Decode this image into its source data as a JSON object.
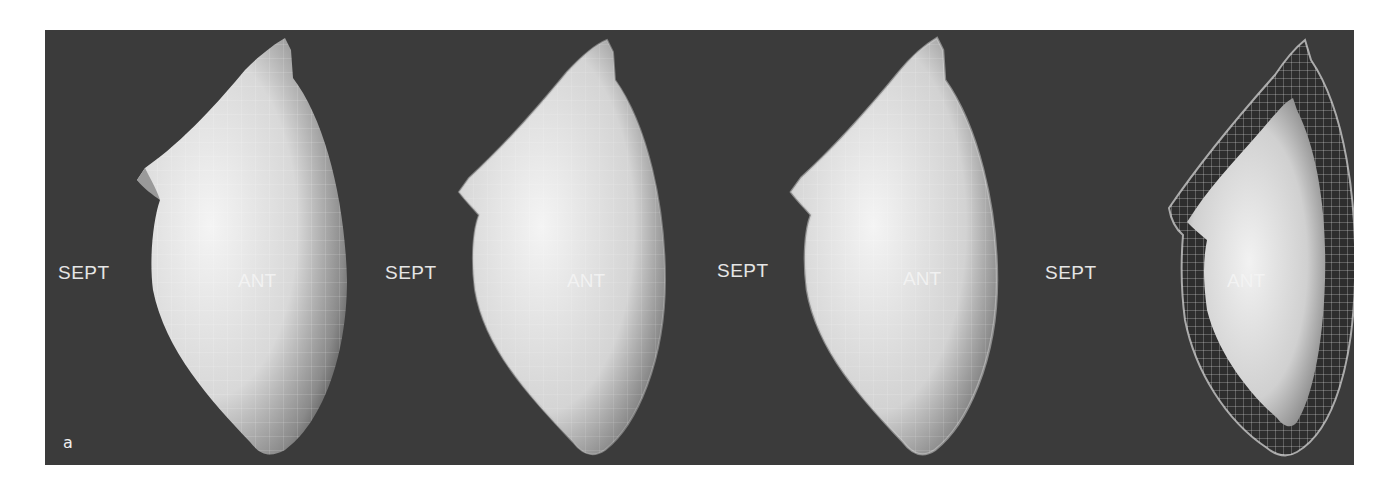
{
  "figure": {
    "panel_label": "a",
    "background_color": "#3b3b3b",
    "panels": [
      {
        "left_label": "SEPT",
        "center_label": "ANT",
        "style": "surface-with-grid"
      },
      {
        "left_label": "SEPT",
        "center_label": "ANT",
        "style": "surface-with-thin-shell"
      },
      {
        "left_label": "SEPT",
        "center_label": "ANT",
        "style": "surface-with-shell-outline"
      },
      {
        "left_label": "SEPT",
        "center_label": "ANT",
        "style": "surface-inside-wireframe-shell"
      }
    ]
  }
}
